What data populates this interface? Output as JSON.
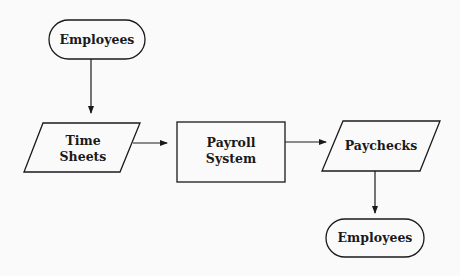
{
  "diagram": {
    "type": "flowchart",
    "nodes": [
      {
        "id": "employees_in",
        "shape": "terminator",
        "label": "Employees"
      },
      {
        "id": "time_sheets",
        "shape": "parallelogram",
        "label_line1": "Time",
        "label_line2": "Sheets"
      },
      {
        "id": "payroll_system",
        "shape": "process",
        "label_line1": "Payroll",
        "label_line2": "System"
      },
      {
        "id": "paychecks",
        "shape": "parallelogram",
        "label": "Paychecks"
      },
      {
        "id": "employees_out",
        "shape": "terminator",
        "label": "Employees"
      }
    ],
    "edges": [
      {
        "from": "employees_in",
        "to": "time_sheets"
      },
      {
        "from": "time_sheets",
        "to": "payroll_system"
      },
      {
        "from": "payroll_system",
        "to": "paychecks"
      },
      {
        "from": "paychecks",
        "to": "employees_out"
      }
    ],
    "colors": {
      "stroke": "#1a1a1a",
      "background": "#fafafa"
    }
  }
}
